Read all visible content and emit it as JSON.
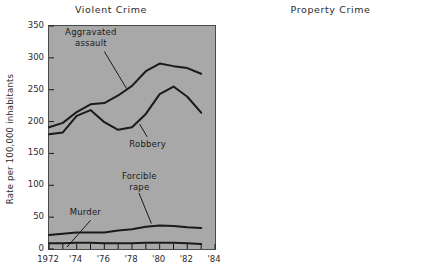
{
  "figure": {
    "panels": [
      {
        "id": "violent",
        "title": "Violent Crime",
        "ylabel": "Rate per 100,000 inhabitants"
      },
      {
        "id": "property",
        "title": "Property Crime",
        "ylabel": "Rate per 100,000 inhabitants"
      }
    ]
  },
  "chart_data": [
    {
      "type": "line",
      "title": "Violent Crime",
      "xlabel": "",
      "ylabel": "Rate per 100,000 inhabitants",
      "xlim": [
        1972,
        1984
      ],
      "ylim": [
        0,
        350
      ],
      "yticks": [
        0,
        50,
        100,
        150,
        200,
        250,
        300,
        350
      ],
      "ytick_labels": [
        "0",
        "50",
        "100",
        "150",
        "200",
        "250",
        "300",
        "350"
      ],
      "xticks": [
        1972,
        1973,
        1974,
        1975,
        1976,
        1977,
        1978,
        1979,
        1980,
        1981,
        1982,
        1983,
        1984
      ],
      "xtick_labels": [
        "1972",
        "'74",
        "'76",
        "'78",
        "'80",
        "'82",
        "'84"
      ],
      "xtick_label_values": [
        1972,
        1974,
        1976,
        1978,
        1980,
        1982,
        1984
      ],
      "grid": false,
      "legend": "inline-annotations",
      "x": [
        1972,
        1973,
        1974,
        1975,
        1976,
        1977,
        1978,
        1979,
        1980,
        1981,
        1982,
        1983
      ],
      "series": [
        {
          "name": "Aggravated assault",
          "values": [
            191,
            198,
            215,
            227,
            229,
            241,
            256,
            279,
            291,
            287,
            284,
            275
          ]
        },
        {
          "name": "Robbery",
          "values": [
            180,
            183,
            209,
            218,
            199,
            187,
            191,
            212,
            243,
            255,
            239,
            214
          ]
        },
        {
          "name": "Forcible rape",
          "values": [
            22,
            24,
            26,
            26,
            26,
            29,
            31,
            35,
            37,
            36,
            34,
            33
          ]
        },
        {
          "name": "Murder",
          "values": [
            9,
            9,
            10,
            10,
            9,
            9,
            9,
            10,
            10,
            10,
            9,
            8
          ]
        }
      ],
      "annotations": [
        {
          "text": "Aggravated\nassault",
          "x": 1975.1,
          "y": 330
        },
        {
          "text": "Robbery",
          "x": 1979.2,
          "y": 163
        },
        {
          "text": "Forcible\nrape",
          "x": 1978.6,
          "y": 104
        },
        {
          "text": "Murder",
          "x": 1974.7,
          "y": 57
        }
      ]
    },
    {
      "type": "line",
      "title": "Property Crime",
      "xlabel": "",
      "ylabel": "Rate per 100,000 inhabitants",
      "xlim": [
        1972,
        1984
      ],
      "ylim": [
        0,
        3500
      ],
      "yticks": [
        0,
        500,
        1000,
        1500,
        2000,
        2500,
        3000,
        3500
      ],
      "ytick_labels": [
        "0",
        "500",
        "1000",
        "1500",
        "2000",
        "2500",
        "3000",
        "3500"
      ],
      "xticks": [
        1972,
        1973,
        1974,
        1975,
        1976,
        1977,
        1978,
        1979,
        1980,
        1981,
        1982,
        1983,
        1984
      ],
      "xtick_labels": [
        "1972",
        "'74",
        "'76",
        "'78",
        "'80",
        "'82",
        "'84"
      ],
      "xtick_label_values": [
        1972,
        1974,
        1976,
        1978,
        1980,
        1982,
        1984
      ],
      "grid": false,
      "legend": "inline-annotations",
      "x": [
        1972,
        1973,
        1974,
        1975,
        1976,
        1977,
        1978,
        1979,
        1980,
        1981,
        1982,
        1983
      ],
      "series": [
        {
          "name": "Larceny-theft",
          "values": [
            1970,
            2070,
            2490,
            2840,
            2940,
            2730,
            2750,
            2990,
            3200,
            3180,
            3080,
            2890
          ]
        },
        {
          "name": "Burglary",
          "values": [
            1100,
            1220,
            1440,
            1500,
            1400,
            1390,
            1440,
            1540,
            1620,
            1620,
            1500,
            1320
          ]
        }
      ],
      "annotations": [
        {
          "text": "Larceny-\ntheft",
          "x": 1979.0,
          "y": 2300
        },
        {
          "text": "Burglary",
          "x": 1978.6,
          "y": 1010
        }
      ]
    }
  ]
}
